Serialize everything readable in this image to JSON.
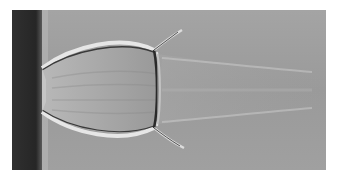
{
  "image": {
    "description": "Grayscale schlieren photograph of an underexpanded supersonic jet exiting a nozzle, showing barrel shocks and a Mach disk",
    "colors": {
      "background": "#a0a0a0",
      "nozzle_wall": "#2a2a2a",
      "shock_dark": "#2e2e2e",
      "shock_light": "#e4e4e4"
    }
  }
}
